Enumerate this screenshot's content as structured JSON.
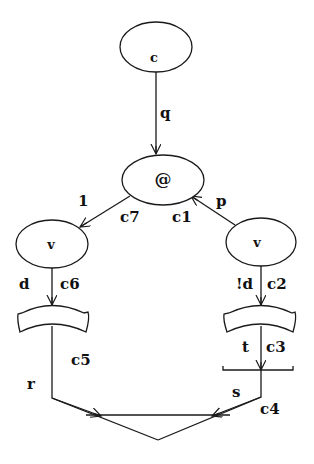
{
  "diagram": {
    "nodes": [
      {
        "id": "n-c",
        "label": "c",
        "shape": "ellipse",
        "cx": 156,
        "cy": 47,
        "rx": 36,
        "ry": 25
      },
      {
        "id": "n-at",
        "label": "@",
        "shape": "ellipse",
        "cx": 163,
        "cy": 180,
        "rx": 41,
        "ry": 25
      },
      {
        "id": "n-v-left",
        "label": "v",
        "shape": "ellipse",
        "cx": 52,
        "cy": 244,
        "rx": 36,
        "ry": 24
      },
      {
        "id": "n-v-right",
        "label": "v",
        "shape": "ellipse",
        "cx": 261,
        "cy": 242,
        "rx": 35,
        "ry": 24
      },
      {
        "id": "n-tray-left",
        "label": "",
        "shape": "tray"
      },
      {
        "id": "n-tray-right",
        "label": "",
        "shape": "tray"
      },
      {
        "id": "n-bar",
        "label": "",
        "shape": "bar"
      },
      {
        "id": "n-merge",
        "label": "",
        "shape": "merge-triangle"
      }
    ],
    "edges": [
      {
        "from": "n-c",
        "to": "n-at",
        "labels": [
          "q"
        ]
      },
      {
        "from": "n-at",
        "to": "n-v-left",
        "labels": [
          "1",
          "c7"
        ]
      },
      {
        "from": "n-v-right",
        "to": "n-at",
        "labels": [
          "p",
          "c1"
        ]
      },
      {
        "from": "n-v-left",
        "to": "n-tray-left",
        "labels": [
          "d",
          "c6"
        ]
      },
      {
        "from": "n-v-right",
        "to": "n-tray-right",
        "labels": [
          "!d",
          "c2"
        ]
      },
      {
        "from": "n-tray-right",
        "to": "n-bar",
        "labels": [
          "t",
          "c3"
        ]
      },
      {
        "from": "n-tray-left",
        "to": "n-merge",
        "labels": [
          "r",
          "c5"
        ]
      },
      {
        "from": "n-bar",
        "to": "n-merge",
        "labels": [
          "s",
          "c4"
        ]
      }
    ],
    "text": {
      "node_c": "c",
      "node_at": "@",
      "node_v_left": "v",
      "node_v_right": "v",
      "edge_q": "q",
      "edge_1": "1",
      "edge_c7": "c7",
      "edge_c1": "c1",
      "edge_p": "p",
      "edge_d": "d",
      "edge_c6": "c6",
      "edge_not_d": "!d",
      "edge_c2": "c2",
      "edge_c5": "c5",
      "edge_t": "t",
      "edge_c3": "c3",
      "edge_r": "r",
      "edge_s": "s",
      "edge_c4": "c4"
    },
    "colors": {
      "stroke": "#1a1a1a",
      "background": "#ffffff"
    }
  }
}
